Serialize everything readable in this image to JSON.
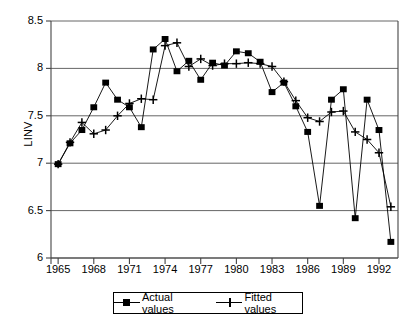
{
  "chart_data": {
    "type": "line",
    "title": "",
    "xlabel": "",
    "ylabel": "LINV",
    "xlim": [
      1964.4,
      1993.6
    ],
    "ylim": [
      6,
      8.5
    ],
    "grid": true,
    "grid_axis": "y",
    "legend_position": "bottom-center",
    "ytick_labels": [
      "8.5",
      "8",
      "7.5",
      "7",
      "6.5",
      "6"
    ],
    "yticks": [
      8.5,
      8,
      7.5,
      7,
      6.5,
      6
    ],
    "xtick_labels": [
      "1965",
      "1968",
      "1971",
      "1974",
      "1977",
      "1980",
      "1983",
      "1986",
      "1989",
      "1992"
    ],
    "xticks": [
      1965,
      1968,
      1971,
      1974,
      1977,
      1980,
      1983,
      1986,
      1989,
      1992
    ],
    "x": [
      1965,
      1966,
      1967,
      1968,
      1969,
      1970,
      1971,
      1972,
      1973,
      1974,
      1975,
      1976,
      1977,
      1978,
      1979,
      1980,
      1981,
      1982,
      1983,
      1984,
      1985,
      1986,
      1987,
      1988,
      1989,
      1990,
      1991,
      1992,
      1993
    ],
    "series": [
      {
        "name": "Actual values",
        "marker": "square",
        "color": "#000000",
        "values": [
          6.99,
          7.21,
          7.35,
          7.59,
          7.85,
          7.67,
          7.59,
          7.38,
          8.2,
          8.31,
          7.97,
          8.08,
          7.88,
          8.06,
          8.03,
          8.18,
          8.16,
          8.07,
          7.75,
          7.85,
          7.6,
          7.33,
          6.55,
          7.67,
          7.78,
          6.42,
          7.67,
          7.35,
          6.17
        ]
      },
      {
        "name": "Fitted values",
        "marker": "plus",
        "color": "#000000",
        "values": [
          6.99,
          7.22,
          7.43,
          7.31,
          7.35,
          7.5,
          7.63,
          7.68,
          7.67,
          8.24,
          8.27,
          8.02,
          8.1,
          8.03,
          8.05,
          8.05,
          8.06,
          8.05,
          8.02,
          7.86,
          7.66,
          7.48,
          7.44,
          7.54,
          7.55,
          7.33,
          7.25,
          7.11,
          6.54
        ]
      }
    ]
  },
  "legend": {
    "entries": [
      {
        "label": "Actual values"
      },
      {
        "label": "Fitted values"
      }
    ]
  }
}
